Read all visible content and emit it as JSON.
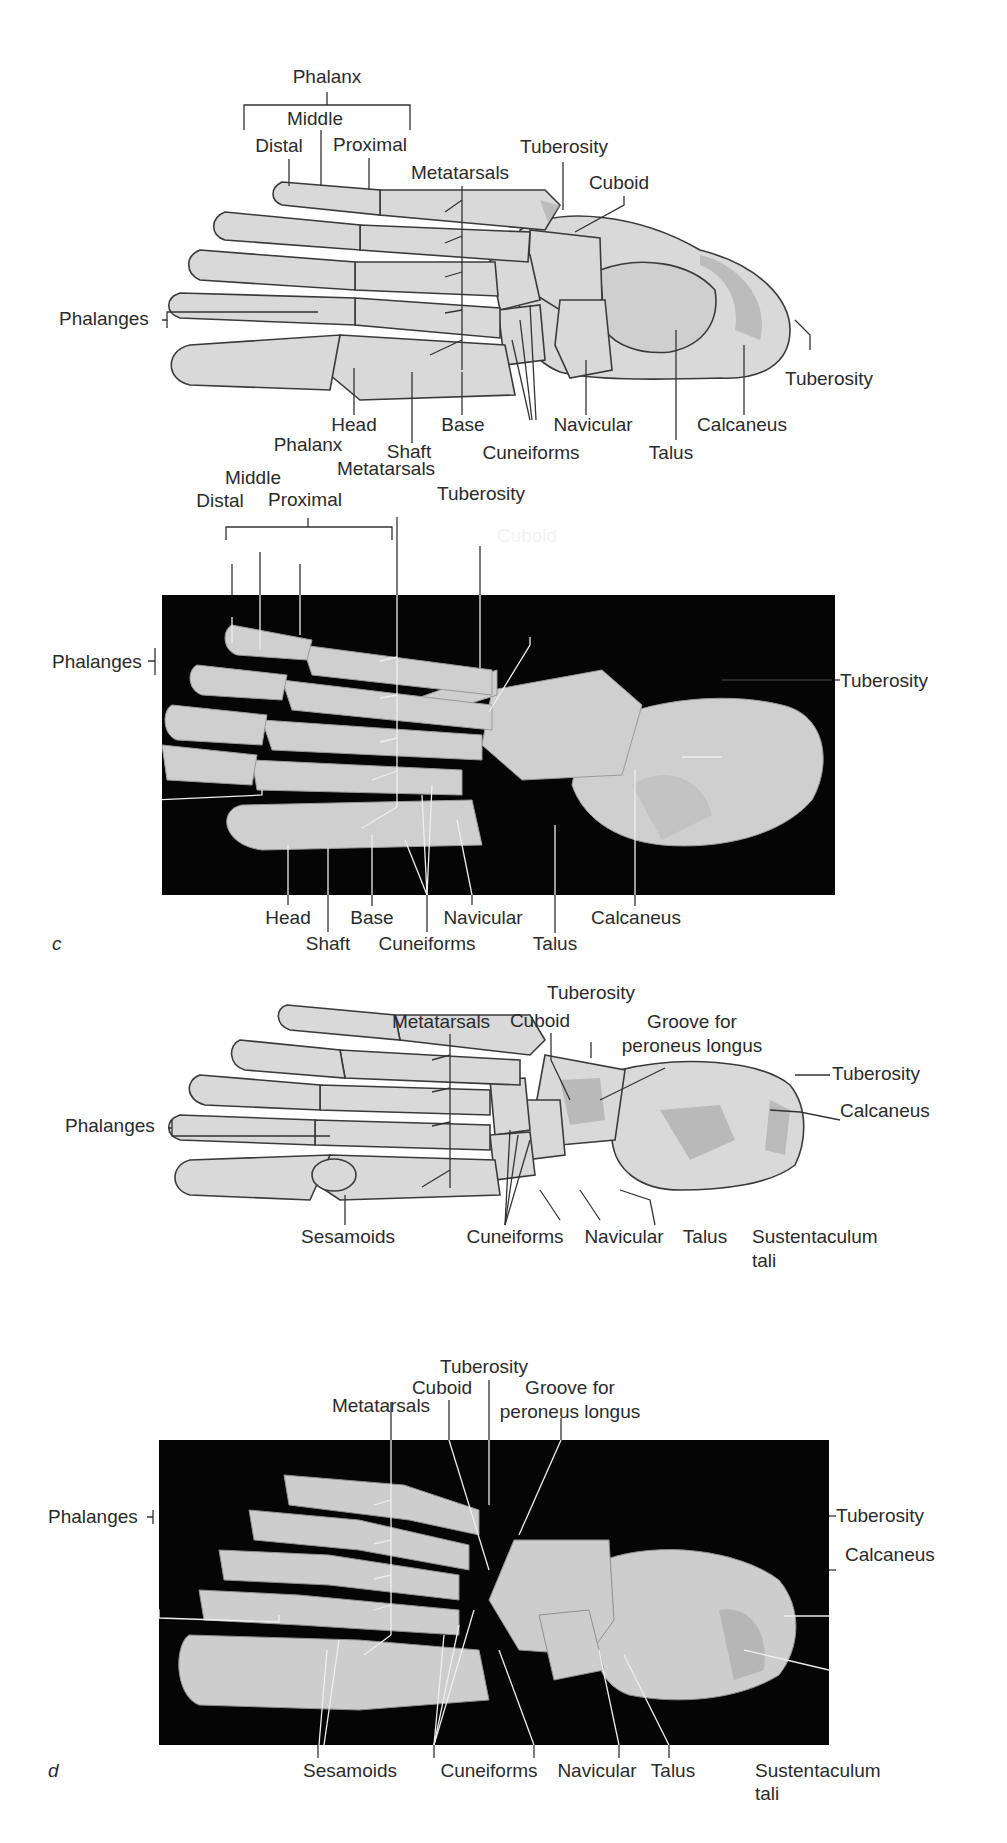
{
  "figure": {
    "colors": {
      "background": "#ffffff",
      "bone_fill": "#d9d9d9",
      "bone_shade": "#a9a9a9",
      "bone_outline": "#3a3a3a",
      "photo_background": "#050505",
      "photo_bone": "#d4d4d4",
      "label_text": "#2b2b2b",
      "leader_line_dark": "#333333",
      "leader_line_light": "#eeeeee"
    }
  },
  "panels": [
    {
      "id": "a",
      "type": "illustration",
      "view": "dorsal",
      "panel_letter": "",
      "labels": {
        "phalanx": "Phalanx",
        "middle": "Middle",
        "distal": "Distal",
        "proximal": "Proximal",
        "metatarsals": "Metatarsals",
        "tuberosity_top": "Tuberosity",
        "cuboid": "Cuboid",
        "phalanges": "Phalanges",
        "tuberosity_right": "Tuberosity",
        "head": "Head",
        "base": "Base",
        "shaft": "Shaft",
        "navicular": "Navicular",
        "cuneiforms": "Cuneiforms",
        "talus": "Talus",
        "calcaneus": "Calcaneus"
      }
    },
    {
      "id": "b",
      "type": "photograph",
      "view": "dorsal",
      "panel_letter": "c",
      "labels": {
        "phalanx": "Phalanx",
        "middle": "Middle",
        "distal": "Distal",
        "proximal": "Proximal",
        "metatarsals": "Metatarsals",
        "tuberosity_top": "Tuberosity",
        "cuboid": "Cuboid",
        "phalanges": "Phalanges",
        "tuberosity_right": "Tuberosity",
        "head": "Head",
        "base": "Base",
        "shaft": "Shaft",
        "navicular": "Navicular",
        "cuneiforms": "Cuneiforms",
        "talus": "Talus",
        "calcaneus": "Calcaneus"
      }
    },
    {
      "id": "c",
      "type": "illustration",
      "view": "plantar",
      "panel_letter": "",
      "labels": {
        "tuberosity_top": "Tuberosity",
        "metatarsals": "Metatarsals",
        "cuboid": "Cuboid",
        "groove_line1": "Groove for",
        "groove_line2": "peroneus longus",
        "phalanges": "Phalanges",
        "tuberosity_right": "Tuberosity",
        "calcaneus": "Calcaneus",
        "sesamoids": "Sesamoids",
        "cuneiforms": "Cuneiforms",
        "navicular": "Navicular",
        "talus": "Talus",
        "sustentaculum_line1": "Sustentaculum",
        "sustentaculum_line2": "tali"
      }
    },
    {
      "id": "d",
      "type": "photograph",
      "view": "plantar",
      "panel_letter": "d",
      "labels": {
        "tuberosity_top": "Tuberosity",
        "cuboid": "Cuboid",
        "groove_line1": "Groove for",
        "groove_line2": "peroneus longus",
        "metatarsals": "Metatarsals",
        "phalanges": "Phalanges",
        "tuberosity_right": "Tuberosity",
        "calcaneus": "Calcaneus",
        "sesamoids": "Sesamoids",
        "cuneiforms": "Cuneiforms",
        "navicular": "Navicular",
        "talus": "Talus",
        "sustentaculum_line1": "Sustentaculum",
        "sustentaculum_line2": "tali"
      }
    }
  ]
}
